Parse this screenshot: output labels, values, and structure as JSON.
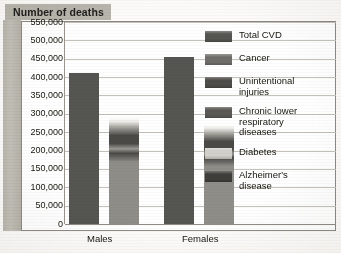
{
  "title": "Number of deaths",
  "axis": {
    "ytick_labels": [
      "550,000",
      "500,000",
      "450,000",
      "400,000",
      "350,000",
      "300,000",
      "250,000",
      "200,000",
      "150,000",
      "100,000",
      "50,000",
      "0"
    ],
    "xtick_labels": [
      "Males",
      "Females"
    ]
  },
  "legend": {
    "items": [
      {
        "label": "Total CVD",
        "color": "#555551"
      },
      {
        "label": "Cancer",
        "color": "#6f6e6a"
      },
      {
        "label": "Unintentional\ninjuries",
        "color": "#4e4d49"
      },
      {
        "label": "Chronic lower\nrespiratory\ndiseases",
        "color": "#5a5955"
      },
      {
        "label": "Diabetes",
        "color": "#d2d0cb"
      },
      {
        "label": "Alzheimer's\ndisease",
        "color": "#3f3e3b"
      }
    ]
  },
  "colors": {
    "total_cvd": "#555551",
    "cancer": "#8e8d88",
    "cancer_cap_dark": "#4a4945",
    "plot_bg": "#ffffff",
    "grid": "#c4c1ba",
    "frame": "#8d8a83",
    "banner": "#b8b5ac",
    "band": "#bcb9b0",
    "text": "#16160f"
  },
  "chart_data": {
    "type": "bar",
    "title": "Number of deaths",
    "xlabel": "",
    "ylabel": "Number of deaths",
    "ylim": [
      0,
      550000
    ],
    "ytick_step": 50000,
    "grid": true,
    "legend_position": "right",
    "categories": [
      "Males",
      "Females"
    ],
    "series": [
      {
        "name": "Total CVD",
        "values": [
          410000,
          455000
        ]
      },
      {
        "name": "Cancer",
        "values": [
          290000,
          270000
        ]
      }
    ]
  }
}
